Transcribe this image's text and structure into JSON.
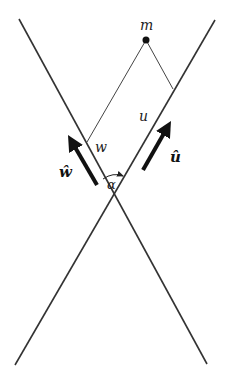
{
  "diagram": {
    "type": "geometric-figure",
    "colors": {
      "line": "#333333",
      "thin_line": "#444444",
      "arrow": "#111111",
      "background": "#ffffff"
    },
    "labels": {
      "point_m": "m",
      "segment_w": "w",
      "segment_u": "u",
      "unit_vector_w": "ŵ",
      "unit_vector_u": "û",
      "angle": "α"
    },
    "elements": {
      "line_left": {
        "x1": 19,
        "y1": 19,
        "x2": 207,
        "y2": 364
      },
      "line_right": {
        "x1": 215,
        "y1": 20,
        "x2": 15,
        "y2": 365
      },
      "point_m": {
        "cx": 146,
        "cy": 40,
        "r": 3.5
      },
      "perp_to_left": {
        "x1": 146,
        "y1": 40,
        "x2": 87,
        "y2": 142
      },
      "perp_to_right": {
        "x1": 146,
        "y1": 40,
        "x2": 173,
        "y2": 89
      },
      "arrow_w_hat": {
        "tail_x": 97,
        "tail_y": 185,
        "tip_x": 67,
        "tip_y": 134
      },
      "arrow_u_hat": {
        "tail_x": 143,
        "tail_y": 170,
        "tip_x": 172,
        "tip_y": 120
      }
    }
  }
}
